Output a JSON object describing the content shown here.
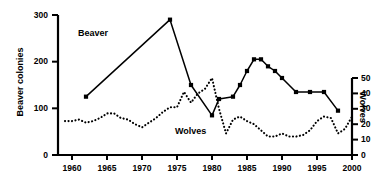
{
  "chart_data": {
    "type": "line",
    "title": "",
    "xlabel": "",
    "xlim": [
      1958,
      2000
    ],
    "xticks": [
      1960,
      1965,
      1970,
      1975,
      1980,
      1985,
      1990,
      1995,
      2000
    ],
    "grid": false,
    "legend_position": "inline-annotations",
    "axes": [
      {
        "id": "left",
        "label": "Beaver colonies",
        "ylim": [
          0,
          300
        ],
        "yticks": [
          0,
          100,
          200,
          300
        ]
      },
      {
        "id": "right",
        "label": "Wolves",
        "ylim": [
          0,
          50
        ],
        "yticks": [
          0,
          10,
          20,
          30,
          40,
          50
        ]
      }
    ],
    "series": [
      {
        "name": "Beaver",
        "axis": "left",
        "style": "solid",
        "marker": "square",
        "annotation": "Beaver",
        "x": [
          1962,
          1974,
          1977,
          1980,
          1981,
          1983,
          1984,
          1985,
          1986,
          1987,
          1988,
          1989,
          1990,
          1992,
          1994,
          1996,
          1998
        ],
        "values": [
          125,
          290,
          150,
          85,
          120,
          125,
          150,
          180,
          205,
          205,
          190,
          180,
          165,
          135,
          135,
          135,
          95
        ]
      },
      {
        "name": "Wolves",
        "axis": "right",
        "style": "dotted",
        "marker": "none",
        "annotation": "Wolves",
        "x": [
          1959,
          1960,
          1961,
          1962,
          1963,
          1964,
          1965,
          1966,
          1967,
          1968,
          1969,
          1970,
          1971,
          1972,
          1973,
          1974,
          1975,
          1976,
          1977,
          1978,
          1979,
          1980,
          1981,
          1982,
          1983,
          1984,
          1985,
          1986,
          1987,
          1988,
          1989,
          1990,
          1991,
          1992,
          1993,
          1994,
          1995,
          1996,
          1997,
          1998,
          1999,
          2000
        ],
        "values": [
          22,
          22,
          23,
          21,
          22,
          24,
          27,
          27,
          24,
          23,
          20,
          18,
          21,
          24,
          28,
          31,
          31,
          41,
          34,
          40,
          43,
          50,
          30,
          14,
          23,
          25,
          22,
          20,
          16,
          12,
          12,
          14,
          12,
          12,
          13,
          16,
          22,
          25,
          24,
          14,
          17,
          25
        ]
      }
    ]
  },
  "annotations": {
    "beaver_label": "Beaver",
    "wolves_label": "Wolves"
  }
}
